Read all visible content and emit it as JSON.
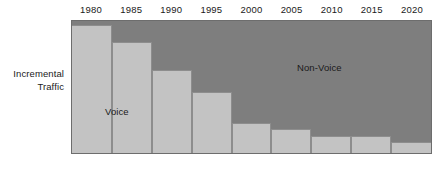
{
  "axes": {
    "y_label_lines": [
      "Incremental",
      "Traffic"
    ]
  },
  "series_labels": {
    "voice": "Voice",
    "non_voice": "Non-Voice"
  },
  "colors": {
    "voice_fill": "#c3c3c3",
    "non_voice_fill": "#7e7e7e",
    "outline": "#6d6d6d",
    "text": "#1a1a1a",
    "background": "#ffffff"
  },
  "chart_data": {
    "type": "bar",
    "title": "",
    "subtitle": "",
    "xlabel": "",
    "ylabel": "Incremental Traffic",
    "stacked": true,
    "grid": false,
    "legend_position": "in-plot",
    "axis_labels_position": "top",
    "ylim": [
      0,
      100
    ],
    "y_ticks": [],
    "categories": [
      "1980",
      "1985",
      "1990",
      "1995",
      "2000",
      "2005",
      "2010",
      "2015",
      "2020"
    ],
    "series": [
      {
        "name": "Voice",
        "color": "#c3c3c3",
        "values": [
          97,
          84,
          63,
          46,
          23,
          18,
          13,
          13,
          8
        ]
      },
      {
        "name": "Non-Voice",
        "color": "#7e7e7e",
        "values": [
          3,
          16,
          37,
          54,
          77,
          82,
          87,
          87,
          92
        ]
      }
    ],
    "annotations": [
      {
        "text": "Voice",
        "series": "Voice"
      },
      {
        "text": "Non-Voice",
        "series": "Non-Voice"
      }
    ]
  }
}
